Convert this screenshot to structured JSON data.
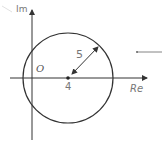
{
  "diagram": {
    "type": "complex-plane-circle",
    "axes": {
      "real_label": "Re",
      "imag_label": "Im",
      "origin_label": "O"
    },
    "circle": {
      "center_label": "4",
      "radius_label": "5",
      "center_value": 4,
      "radius_value": 5
    },
    "colors": {
      "stroke": "#333333",
      "label": "#777777",
      "faint": "#dddddd"
    }
  }
}
